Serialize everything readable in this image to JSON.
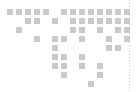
{
  "widget": {
    "name": "dot-matrix-world-map",
    "title": "World Map",
    "width": 136,
    "height": 92,
    "background_color": "#ffffff"
  },
  "grid": {
    "cell_size": 6,
    "pitch_x": 9,
    "pitch_y": 9,
    "origin_x": 7,
    "origin_y": 9,
    "columns": 14,
    "rows": 9,
    "dot_color": "#c9c9c9"
  },
  "axis_line": {
    "name": "right-dotted-axis",
    "x": 129,
    "color": "#c9c9c9",
    "style": "dotted",
    "orientation": "vertical"
  },
  "chart_data": {
    "type": "heatmap",
    "title": "World Map",
    "subtitle": "",
    "xlabel": "",
    "ylabel": "",
    "grid": false,
    "legend_position": "none",
    "x": [
      0,
      1,
      2,
      3,
      4,
      5,
      6,
      7,
      8,
      9,
      10,
      11,
      12,
      13
    ],
    "y": [
      0,
      1,
      2,
      3,
      4,
      5,
      6,
      7,
      8
    ],
    "xlim": [
      0,
      13
    ],
    "ylim": [
      0,
      8
    ],
    "value_color": "#c9c9c9",
    "empty_color": "#ffffff",
    "cells": [
      {
        "col": 0,
        "row": 0
      },
      {
        "col": 1,
        "row": 0
      },
      {
        "col": 2,
        "row": 0
      },
      {
        "col": 3,
        "row": 0
      },
      {
        "col": 4,
        "row": 0
      },
      {
        "col": 6,
        "row": 0
      },
      {
        "col": 7,
        "row": 0
      },
      {
        "col": 8,
        "row": 0
      },
      {
        "col": 9,
        "row": 0
      },
      {
        "col": 10,
        "row": 0
      },
      {
        "col": 11,
        "row": 0
      },
      {
        "col": 12,
        "row": 0
      },
      {
        "col": 13,
        "row": 0
      },
      {
        "col": 2,
        "row": 1
      },
      {
        "col": 3,
        "row": 1
      },
      {
        "col": 5,
        "row": 1
      },
      {
        "col": 7,
        "row": 1
      },
      {
        "col": 8,
        "row": 1
      },
      {
        "col": 9,
        "row": 1
      },
      {
        "col": 10,
        "row": 1
      },
      {
        "col": 11,
        "row": 1
      },
      {
        "col": 12,
        "row": 1
      },
      {
        "col": 13,
        "row": 1
      },
      {
        "col": 1,
        "row": 2
      },
      {
        "col": 7,
        "row": 2
      },
      {
        "col": 8,
        "row": 2
      },
      {
        "col": 10,
        "row": 2
      },
      {
        "col": 12,
        "row": 2
      },
      {
        "col": 13,
        "row": 2
      },
      {
        "col": 3,
        "row": 3
      },
      {
        "col": 5,
        "row": 3
      },
      {
        "col": 6,
        "row": 3
      },
      {
        "col": 8,
        "row": 3
      },
      {
        "col": 11,
        "row": 3
      },
      {
        "col": 13,
        "row": 3
      },
      {
        "col": 5,
        "row": 4
      },
      {
        "col": 11,
        "row": 4
      },
      {
        "col": 12,
        "row": 4
      },
      {
        "col": 5,
        "row": 5
      },
      {
        "col": 6,
        "row": 5
      },
      {
        "col": 8,
        "row": 5
      },
      {
        "col": 5,
        "row": 6
      },
      {
        "col": 6,
        "row": 6
      },
      {
        "col": 8,
        "row": 6
      },
      {
        "col": 10,
        "row": 6
      },
      {
        "col": 6,
        "row": 7
      },
      {
        "col": 10,
        "row": 7
      },
      {
        "col": 9,
        "row": 8
      }
    ]
  }
}
